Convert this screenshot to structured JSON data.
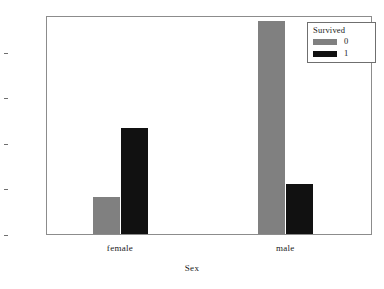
{
  "chart_data": {
    "type": "bar",
    "title": "",
    "subtitle": "",
    "xlabel": "Sex",
    "ylabel": "",
    "categories": [
      "female",
      "male"
    ],
    "series": [
      {
        "name": "0",
        "values": [
          81,
          468
        ],
        "color": "#808080"
      },
      {
        "name": "1",
        "values": [
          233,
          109
        ],
        "color": "#111111"
      }
    ],
    "legend": {
      "title": "Survived",
      "position": "top-right",
      "entries": [
        {
          "label": "0",
          "color": "#808080"
        },
        {
          "label": "1",
          "color": "#111111"
        }
      ]
    },
    "yticks": [
      0,
      100,
      200,
      300,
      400
    ],
    "ytick_labels": [
      "0",
      "100",
      "200",
      "300",
      "400"
    ],
    "ylim": [
      0,
      481
    ],
    "xtick_labels": [
      "female",
      "male"
    ],
    "grid": false,
    "frame": true,
    "background_color": "#ffffff",
    "frame_color": "#8c8c8c"
  }
}
